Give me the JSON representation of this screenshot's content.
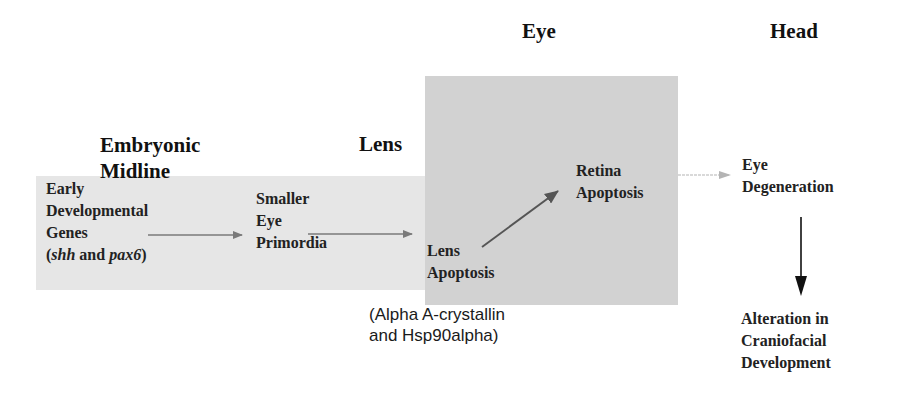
{
  "headers": {
    "embryonic_midline_line1": "Embryonic",
    "embryonic_midline_line2": "Midline",
    "lens": "Lens",
    "eye": "Eye",
    "head": "Head"
  },
  "nodes": {
    "early_genes": {
      "line1": "Early",
      "line2": "Developmental",
      "line3": "Genes",
      "line4_open": "(",
      "line4_gene1": "shh",
      "line4_and": " and ",
      "line4_gene2": "pax6",
      "line4_close": ")"
    },
    "smaller_eye": {
      "line1": "Smaller",
      "line2": "Eye",
      "line3": "Primordia"
    },
    "lens_apoptosis": {
      "line1": "Lens",
      "line2": "Apoptosis"
    },
    "retina_apoptosis": {
      "line1": "Retina",
      "line2": "Apoptosis"
    },
    "eye_degeneration": {
      "line1": "Eye",
      "line2": "Degeneration"
    },
    "craniofacial": {
      "line1": "Alteration in",
      "line2": "Craniofacial",
      "line3": "Development"
    }
  },
  "annotation": {
    "line1": "(Alpha A-crystallin",
    "line2": "and Hsp90alpha)"
  },
  "colors": {
    "midline_band": "#e6e6e6",
    "eye_box": "#d2d2d2",
    "arrow_gray": "#7a7a7a",
    "arrow_light": "#b4b4b4",
    "arrow_dark": "#222222"
  }
}
